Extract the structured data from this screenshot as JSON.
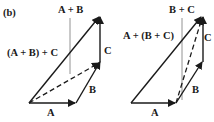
{
  "panel_label": "(b)",
  "left": {
    "labels": {
      "A": "A",
      "B": "B",
      "C": "C",
      "AB": "A + B",
      "sum": "(A + B) + C"
    }
  },
  "right": {
    "labels": {
      "A": "A",
      "B": "B",
      "C": "C",
      "BC": "B + C",
      "sum": "A + (B + C)"
    }
  },
  "colors": {
    "ink": "#1a1a1a",
    "leader": "#777777"
  }
}
